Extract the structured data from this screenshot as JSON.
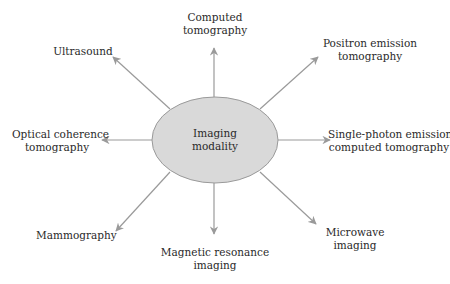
{
  "diagram": {
    "center": {
      "lines": [
        "Imaging",
        "modality"
      ]
    },
    "nodes": [
      {
        "id": "computed-tomography",
        "lines": [
          "Computed",
          "tomography"
        ]
      },
      {
        "id": "positron-emission-tomography",
        "lines": [
          "Positron emission",
          "tomography"
        ]
      },
      {
        "id": "spect",
        "lines": [
          "Single-photon emission",
          "computed tomography"
        ]
      },
      {
        "id": "microwave-imaging",
        "lines": [
          "Microwave",
          "imaging"
        ]
      },
      {
        "id": "magnetic-resonance-imaging",
        "lines": [
          "Magnetic resonance",
          "imaging"
        ]
      },
      {
        "id": "mammography",
        "lines": [
          "Mammography"
        ]
      },
      {
        "id": "optical-coherence-tomography",
        "lines": [
          "Optical coherence",
          "tomography"
        ]
      },
      {
        "id": "ultrasound",
        "lines": [
          "Ultrasound"
        ]
      }
    ],
    "colors": {
      "ellipse_fill": "#d9d9d9",
      "ellipse_stroke": "#9a9a9a",
      "arrow": "#9a9a9a",
      "text": "#2a2a2a"
    }
  }
}
